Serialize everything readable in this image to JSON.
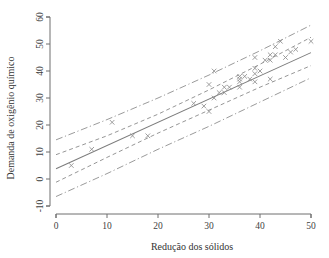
{
  "chart_data": {
    "type": "scatter",
    "title": "",
    "xlabel": "Redução dos sólidos",
    "ylabel": "Demanda de oxigênio químico",
    "xlim": [
      0,
      50
    ],
    "ylim": [
      -10,
      60
    ],
    "xticks": [
      0,
      10,
      20,
      30,
      40,
      50
    ],
    "yticks": [
      -10,
      0,
      10,
      20,
      30,
      40,
      50,
      60
    ],
    "xtick_labels": [
      "0",
      "10",
      "20",
      "30",
      "40",
      "50"
    ],
    "ytick_labels": [
      "-10",
      "0",
      "10",
      "20",
      "30",
      "40",
      "50",
      "60"
    ],
    "grid": false,
    "legend": "none",
    "marker": "x",
    "series": [
      {
        "name": "Observações",
        "marker": "x",
        "color": "#8c8c8c",
        "points": [
          [
            3,
            5
          ],
          [
            7,
            11
          ],
          [
            11,
            21
          ],
          [
            15,
            16
          ],
          [
            18,
            16
          ],
          [
            27,
            28
          ],
          [
            29,
            27
          ],
          [
            30,
            25
          ],
          [
            30,
            35
          ],
          [
            31,
            30
          ],
          [
            31,
            40
          ],
          [
            32,
            32
          ],
          [
            33,
            34
          ],
          [
            33,
            32
          ],
          [
            34,
            34
          ],
          [
            36,
            37
          ],
          [
            36,
            38
          ],
          [
            36,
            34
          ],
          [
            36,
            36
          ],
          [
            37,
            38
          ],
          [
            38,
            37
          ],
          [
            39,
            36
          ],
          [
            39,
            45
          ],
          [
            39,
            39
          ],
          [
            39,
            41
          ],
          [
            40,
            40
          ],
          [
            41,
            44
          ],
          [
            42,
            37
          ],
          [
            42,
            44
          ],
          [
            42,
            46
          ],
          [
            43,
            46
          ],
          [
            43,
            49
          ],
          [
            44,
            51
          ],
          [
            45,
            45
          ],
          [
            46,
            47
          ],
          [
            47,
            48
          ],
          [
            50,
            51
          ]
        ]
      }
    ],
    "fit": {
      "name": "Reta de regressão ajustada",
      "style": "solid",
      "color": "#7c7c7c",
      "intercept": 3.8,
      "slope": 0.86,
      "x_start": 0,
      "x_end": 50,
      "y_start": 3.8,
      "y_end": 46.8
    },
    "confidence_band": {
      "name": "Intervalo de confiança para a média",
      "style": "dashed",
      "color": "#8a8a8a",
      "upper": [
        [
          0,
          9.0
        ],
        [
          10,
          16.0
        ],
        [
          20,
          24.0
        ],
        [
          30,
          33.0
        ],
        [
          40,
          42.5
        ],
        [
          50,
          52.5
        ]
      ],
      "lower": [
        [
          0,
          -1.2
        ],
        [
          10,
          8.0
        ],
        [
          20,
          17.0
        ],
        [
          30,
          25.5
        ],
        [
          40,
          34.0
        ],
        [
          50,
          42.0
        ]
      ]
    },
    "prediction_band": {
      "name": "Intervalo de predição",
      "style": "dash-dot",
      "color": "#8f8f8f",
      "upper": [
        [
          0,
          14.5
        ],
        [
          10,
          22.0
        ],
        [
          20,
          30.0
        ],
        [
          30,
          38.5
        ],
        [
          40,
          47.5
        ],
        [
          50,
          57.0
        ]
      ],
      "lower": [
        [
          0,
          -6.5
        ],
        [
          10,
          2.0
        ],
        [
          20,
          11.0
        ],
        [
          30,
          19.5
        ],
        [
          40,
          28.5
        ],
        [
          50,
          37.5
        ]
      ]
    }
  }
}
